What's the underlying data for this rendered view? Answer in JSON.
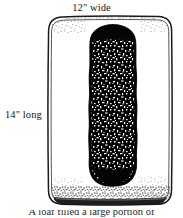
{
  "figure": {
    "background_color": "#ffffff",
    "labels": {
      "width": "12\" wide",
      "length": "14\" long"
    },
    "caption_partial": "A loaf filled a large portion of",
    "pan": {
      "name": "baking-pan",
      "shape": "rounded-rectangle",
      "stroke_color": "#1a1a1a",
      "fill_color": "#ffffff",
      "x": 48,
      "y": 16,
      "width": 124,
      "height": 189,
      "corner_radius": 14,
      "style": "hand-drawn double line with stippled shading"
    },
    "loaf": {
      "name": "bread-loaf",
      "shape": "rounded-vertical-blob",
      "fill_color": "#000000",
      "speckle_color": "#ffffff",
      "x": 90,
      "y": 26,
      "width": 47,
      "height": 158,
      "texture": "dense white mottled speckles on black"
    }
  }
}
